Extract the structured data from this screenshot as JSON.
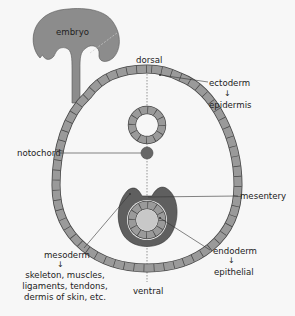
{
  "figure": {
    "inset_label": "embryo",
    "orientation": {
      "top": "dorsal",
      "bottom": "ventral"
    },
    "labels": {
      "ectoderm": "ectoderm",
      "ectoderm_derivative": "epidermis",
      "notochord": "notochord",
      "mesentery": "mesentery",
      "mesoderm": "mesoderm",
      "mesoderm_derivatives": [
        "skeleton, muscles,",
        "ligaments, tendons,",
        "dermis of skin, etc."
      ],
      "endoderm": "endoderm",
      "endoderm_derivative": "epithelial"
    },
    "arrow_glyph": "↓",
    "colors": {
      "background": "#f7f7f7",
      "cell_fill": "#9a9a9a",
      "embryo_fill": "#8c8c8c",
      "mesoderm_fill": "#5f5f5f",
      "notochord_fill": "#666666",
      "gut_lumen": "#c8c8c8",
      "outline": "#444444"
    }
  }
}
